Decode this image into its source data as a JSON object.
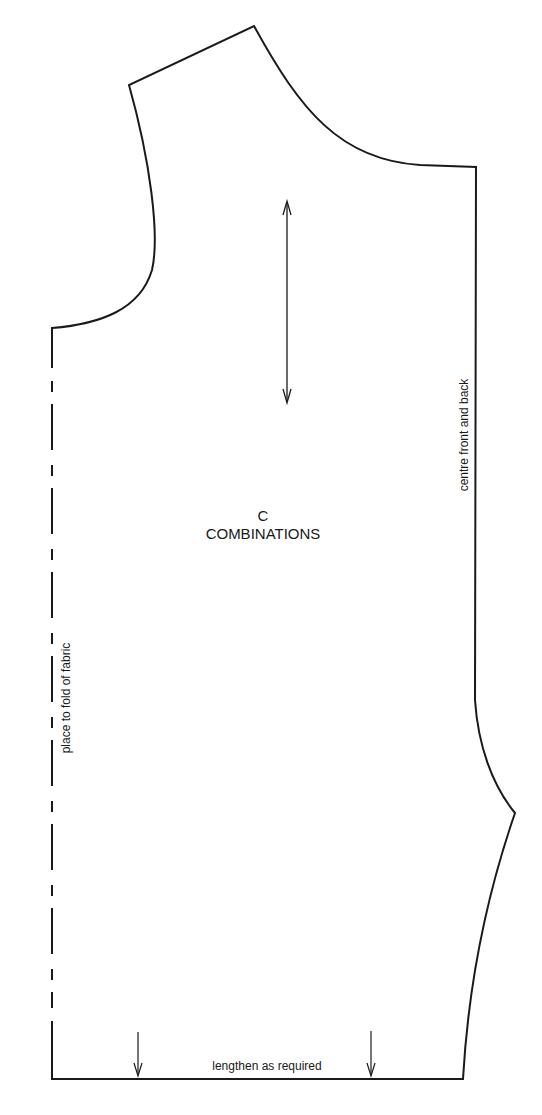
{
  "pattern_piece": {
    "letter": "C",
    "name": "COMBINATIONS",
    "line_color": "#1a1a1a",
    "background": "#ffffff"
  },
  "annotations": {
    "fold": "place to fold of fabric",
    "centre": "centre front and back",
    "lengthen": "lengthen as required"
  },
  "markers": {
    "grainline": "grainline-double-arrow",
    "lengthen_arrows": [
      "down-arrow",
      "down-arrow"
    ]
  }
}
